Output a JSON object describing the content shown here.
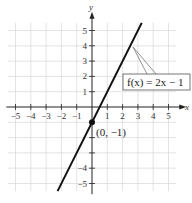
{
  "chart_data": {
    "type": "line",
    "title": "",
    "xlabel": "x",
    "ylabel": "y",
    "xlim": [
      -5.5,
      5.5
    ],
    "ylim": [
      -5.5,
      5.5
    ],
    "grid": true,
    "x_ticks": [
      -5,
      -4,
      -3,
      -2,
      -1,
      1,
      2,
      3,
      4,
      5
    ],
    "y_ticks": [
      5,
      4,
      3,
      2,
      1,
      -4,
      -5
    ],
    "x_tick_labels": [
      "−5",
      "−4",
      "−3",
      "−2",
      "−1",
      "1",
      "2",
      "3",
      "4",
      "5"
    ],
    "y_tick_labels": [
      "5",
      "4",
      "3",
      "2",
      "1",
      "−4",
      "−5"
    ],
    "series": [
      {
        "name": "f(x) = 2x − 1",
        "x": [
          -2.25,
          3.25
        ],
        "y": [
          -5.5,
          5.5
        ],
        "color": "#111111"
      }
    ],
    "annotations": [
      {
        "text": "f(x) = 2x − 1",
        "type": "callout-box"
      },
      {
        "text": "(0, −1)",
        "type": "point-label",
        "x": 0,
        "y": -1
      }
    ]
  },
  "labels": {
    "x_axis": "x",
    "y_axis": "y",
    "equation": "f(x) = 2x − 1",
    "point": "(0, −1)"
  }
}
